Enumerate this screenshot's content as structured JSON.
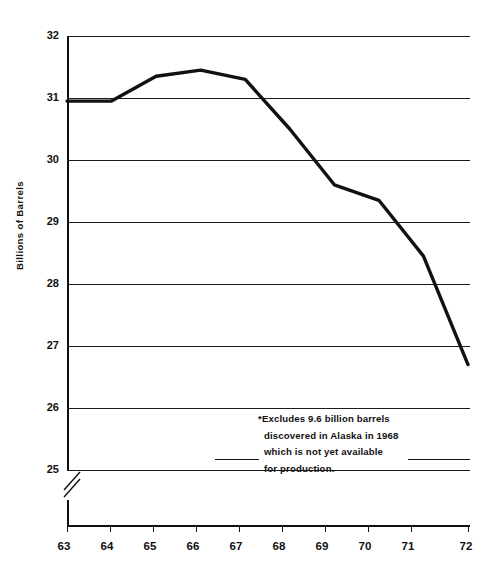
{
  "chart_data": {
    "type": "line",
    "title": "",
    "subtitle": "",
    "xlabel": "",
    "ylabel": "Billions of  Barrels",
    "xlim": [
      63,
      72
    ],
    "ylim": [
      25,
      32
    ],
    "grid": true,
    "legend_position": "none",
    "y_ticks": [
      "32",
      "31",
      "30",
      "29",
      "28",
      "27",
      "26",
      "25"
    ],
    "y_tick_values": [
      32,
      31,
      30,
      29,
      28,
      27,
      26,
      25
    ],
    "x_ticks": [
      "63",
      "64",
      "65",
      "66",
      "67",
      "68",
      "69",
      "70",
      "71",
      "72"
    ],
    "x_tick_values": [
      63,
      64,
      65,
      66,
      67,
      68,
      69,
      70,
      71,
      72
    ],
    "axis_break": "y-axis broken below 25",
    "x": [
      63,
      64,
      65,
      66,
      67,
      68,
      69,
      70,
      71,
      72
    ],
    "values": [
      30.95,
      30.95,
      31.35,
      31.45,
      31.3,
      30.5,
      29.6,
      29.35,
      28.45,
      26.7
    ],
    "series": [
      {
        "name": "Proved crude oil reserves",
        "values": [
          30.95,
          30.95,
          31.35,
          31.45,
          31.3,
          30.5,
          29.6,
          29.35,
          28.45,
          26.7
        ]
      }
    ],
    "annotations": [
      "*Excludes 9.6 billion barrels",
      "discovered in Alaska in 1968",
      "which is not yet available",
      "for production."
    ],
    "line_color": "#111111"
  },
  "chart": {
    "y_axis_title": "Billions of  Barrels",
    "annotation": {
      "line1": "*Excludes 9.6 billion barrels",
      "line2": "discovered in Alaska in 1968",
      "line3": "which is not yet available",
      "line4": "for production."
    },
    "y_labels": {
      "t0": "32",
      "t1": "31",
      "t2": "30",
      "t3": "29",
      "t4": "28",
      "t5": "27",
      "t6": "26",
      "t7": "25"
    },
    "x_labels": {
      "t0": "63",
      "t1": "64",
      "t2": "65",
      "t3": "66",
      "t4": "67",
      "t5": "68",
      "t6": "69",
      "t7": "70",
      "t8": "71",
      "t9": "72"
    }
  }
}
